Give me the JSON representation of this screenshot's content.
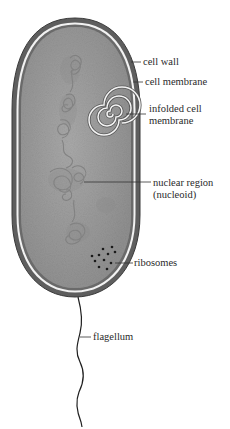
{
  "diagram": {
    "labels": {
      "cell_wall": "cell wall",
      "cell_membrane": "cell membrane",
      "infolded_line1": "infolded cell",
      "infolded_line2": "membrane",
      "nuclear_line1": "nuclear region",
      "nuclear_line2": "(nucleoid)",
      "ribosomes": "ribosomes",
      "flagellum": "flagellum"
    },
    "colors": {
      "cell_wall": "#5e5e5e",
      "membrane_gap": "#f2f2f2",
      "cytoplasm": "#9d9d9d",
      "nucleoid": "#888888",
      "ribosome": "#1a1a1a",
      "leader_line": "#333333"
    }
  }
}
